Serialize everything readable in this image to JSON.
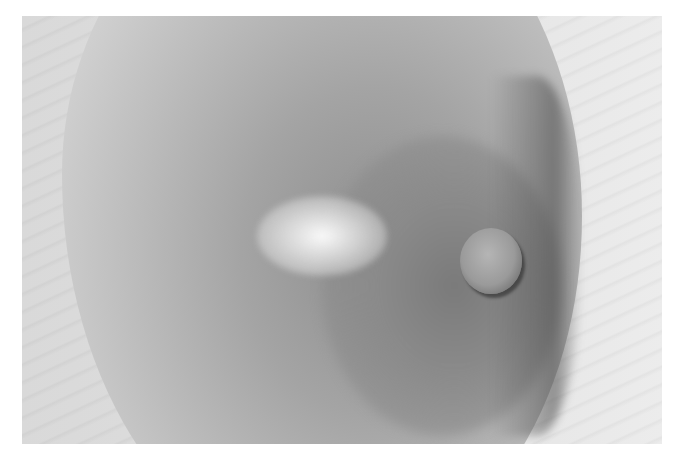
{
  "image": {
    "description": "Grayscale clinical photograph of a breast with a pale patch above the areola",
    "palette": {
      "background": "#ffffff",
      "skin_light": "#dedede",
      "skin_mid": "#a4a4a4",
      "skin_dark": "#7a7a7a",
      "highlight": "#f5f5f5"
    }
  },
  "caption": {
    "text": ""
  }
}
